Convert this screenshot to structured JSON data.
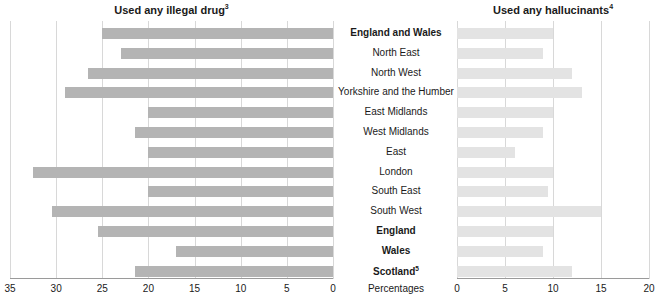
{
  "panels": {
    "left": {
      "title": "Used any illegal drug",
      "title_footnote": "3",
      "axis_ticks": [
        35,
        30,
        25,
        20,
        15,
        10,
        5,
        0
      ],
      "axis_min": 0,
      "axis_max": 35,
      "reversed": true
    },
    "right": {
      "title": "Used any hallucinants",
      "title_footnote": "4",
      "axis_ticks": [
        0,
        5,
        10,
        15,
        20
      ],
      "axis_min": 0,
      "axis_max": 20,
      "reversed": false
    }
  },
  "axis_caption": "Percentages",
  "categories": [
    {
      "label": "England and Wales",
      "bold": true,
      "footnote": ""
    },
    {
      "label": "North East",
      "bold": false,
      "footnote": ""
    },
    {
      "label": "North West",
      "bold": false,
      "footnote": ""
    },
    {
      "label": "Yorkshire and the Humber",
      "bold": false,
      "footnote": ""
    },
    {
      "label": "East Midlands",
      "bold": false,
      "footnote": ""
    },
    {
      "label": "West Midlands",
      "bold": false,
      "footnote": ""
    },
    {
      "label": "East",
      "bold": false,
      "footnote": ""
    },
    {
      "label": "London",
      "bold": false,
      "footnote": ""
    },
    {
      "label": "South East",
      "bold": false,
      "footnote": ""
    },
    {
      "label": "South West",
      "bold": false,
      "footnote": ""
    },
    {
      "label": "England",
      "bold": true,
      "footnote": ""
    },
    {
      "label": "Wales",
      "bold": true,
      "footnote": ""
    },
    {
      "label": "Scotland",
      "bold": true,
      "footnote": "5"
    }
  ],
  "chart_data": {
    "type": "bar",
    "xlabel": "Percentages",
    "ylabel": "",
    "orientation": "horizontal",
    "layout": "back-to-back paired panels with shared central category labels",
    "grid": true,
    "legend": "none",
    "categories": [
      "England and Wales",
      "North East",
      "North West",
      "Yorkshire and the Humber",
      "East Midlands",
      "West Midlands",
      "East",
      "London",
      "South East",
      "South West",
      "England",
      "Wales",
      "Scotland"
    ],
    "series": [
      {
        "name": "Used any illegal drug",
        "panel": "left",
        "xlim": [
          35,
          0
        ],
        "ticks": [
          35,
          30,
          25,
          20,
          15,
          10,
          5,
          0
        ],
        "values": [
          25.0,
          23.0,
          26.5,
          29.0,
          20.0,
          21.5,
          20.0,
          32.5,
          20.0,
          30.5,
          25.5,
          17.0,
          21.5
        ]
      },
      {
        "name": "Used any hallucinants",
        "panel": "right",
        "xlim": [
          0,
          20
        ],
        "ticks": [
          0,
          5,
          10,
          15,
          20
        ],
        "values": [
          10.0,
          9.0,
          12.0,
          13.0,
          10.0,
          9.0,
          6.0,
          10.0,
          9.5,
          15.0,
          10.0,
          9.0,
          12.0
        ]
      }
    ]
  }
}
